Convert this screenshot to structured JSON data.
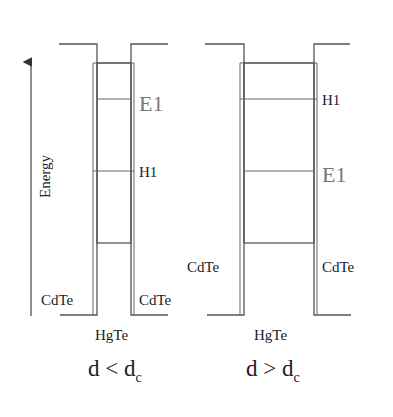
{
  "axis": {
    "label": "Energy",
    "direction": "up"
  },
  "panels": [
    {
      "id": "left",
      "condition": "d < d",
      "condition_sub": "c",
      "well_material": "HgTe",
      "barrier_left_label": "CdTe",
      "barrier_right_label": "CdTe",
      "levels": [
        {
          "label": "E1",
          "position": "upper"
        },
        {
          "label": "H1",
          "position": "lower"
        }
      ]
    },
    {
      "id": "right",
      "condition": "d > d",
      "condition_sub": "c",
      "well_material": "HgTe",
      "barrier_left_label": "CdTe",
      "barrier_right_label": "CdTe",
      "levels": [
        {
          "label": "H1",
          "position": "upper"
        },
        {
          "label": "E1",
          "position": "lower"
        }
      ]
    }
  ]
}
